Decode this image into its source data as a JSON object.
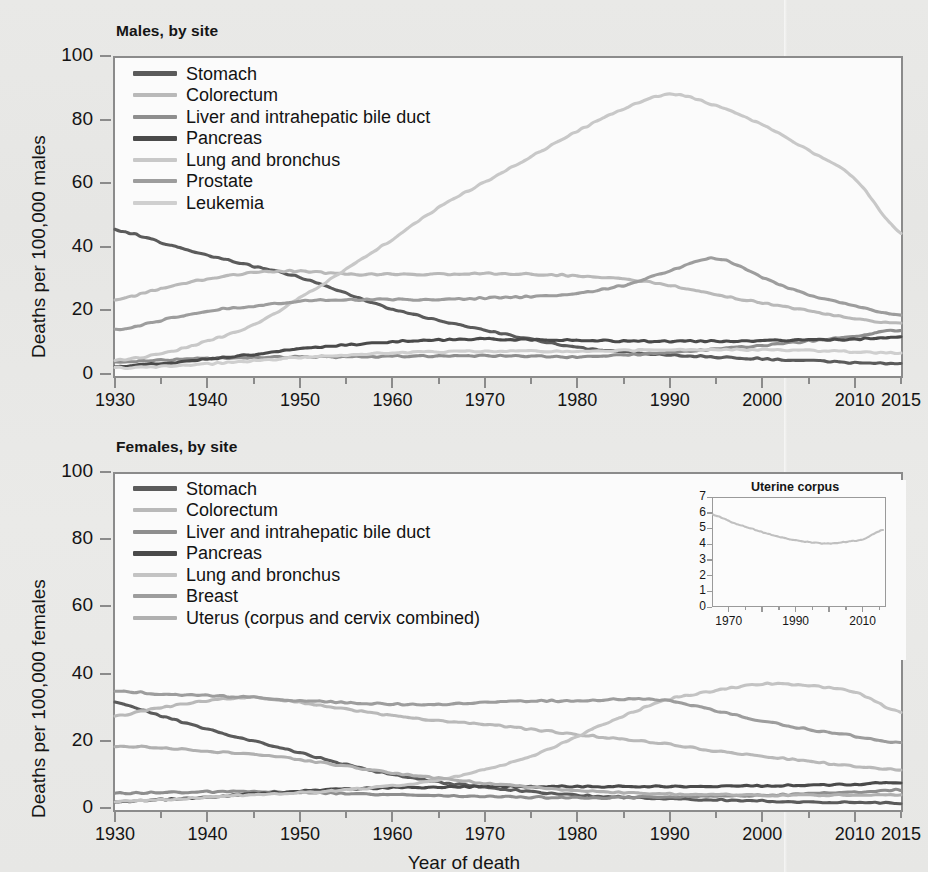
{
  "figure": {
    "xaxis_title": "Year of death",
    "background_hex": "#e8e8e6",
    "axis_hex": "#8b8b8b"
  },
  "panels": [
    {
      "id": "males",
      "title": "Males, by site",
      "ylabel": "Deaths per 100,000 males",
      "yticks": [
        "100",
        "80",
        "60",
        "40",
        "20",
        "0"
      ],
      "xticks": [
        "1930",
        "1940",
        "1950",
        "1960",
        "1970",
        "1980",
        "1990",
        "2000",
        "2010",
        "2015"
      ],
      "legend": [
        {
          "label": "Stomach",
          "color": "#5b5b5b"
        },
        {
          "label": "Colorectum",
          "color": "#b9b9b9"
        },
        {
          "label": "Liver and intrahepatic bile duct",
          "color": "#8e8e8e"
        },
        {
          "label": "Pancreas",
          "color": "#4a4a4a"
        },
        {
          "label": "Lung and bronchus",
          "color": "#c8c8c8"
        },
        {
          "label": "Prostate",
          "color": "#9d9d9d"
        },
        {
          "label": "Leukemia",
          "color": "#cfcfcf"
        }
      ]
    },
    {
      "id": "females",
      "title": "Females, by site",
      "ylabel": "Deaths per 100,000 females",
      "yticks": [
        "100",
        "80",
        "60",
        "40",
        "20",
        "0"
      ],
      "xticks": [
        "1930",
        "1940",
        "1950",
        "1960",
        "1970",
        "1980",
        "1990",
        "2000",
        "2010",
        "2015"
      ],
      "legend": [
        {
          "label": "Stomach",
          "color": "#5b5b5b"
        },
        {
          "label": "Colorectum",
          "color": "#b9b9b9"
        },
        {
          "label": "Liver and intrahepatic bile duct",
          "color": "#8e8e8e"
        },
        {
          "label": "Pancreas",
          "color": "#4a4a4a"
        },
        {
          "label": "Lung and bronchus",
          "color": "#c3c3c3"
        },
        {
          "label": "Breast",
          "color": "#9d9d9d"
        },
        {
          "label": "Uterus (corpus and cervix combined)",
          "color": "#b0b0b0"
        }
      ],
      "inset": {
        "title": "Uterine corpus",
        "yticks": [
          "7",
          "6",
          "5",
          "4",
          "3",
          "2",
          "1",
          "0"
        ],
        "xticks": [
          "1970",
          "1990",
          "2010"
        ]
      }
    }
  ],
  "chart_data": [
    {
      "type": "line",
      "id": "males-by-site",
      "title": "Males, by site",
      "xlabel": "Year of death",
      "ylabel": "Deaths per 100,000 males",
      "xlim": [
        1930,
        2015
      ],
      "ylim": [
        0,
        100
      ],
      "ytick_values": [
        0,
        20,
        40,
        60,
        80,
        100
      ],
      "xtick_values": [
        1930,
        1940,
        1950,
        1960,
        1970,
        1980,
        1990,
        2000,
        2010,
        2015
      ],
      "grid": false,
      "legend_position": "inside-top-left",
      "x": [
        1930,
        1935,
        1940,
        1945,
        1950,
        1955,
        1960,
        1965,
        1970,
        1975,
        1980,
        1985,
        1990,
        1995,
        2000,
        2005,
        2010,
        2015
      ],
      "series": [
        {
          "name": "Stomach",
          "color": "#5b5b5b",
          "values": [
            46.0,
            42.0,
            38.0,
            34.5,
            31.0,
            26.0,
            21.0,
            17.5,
            14.5,
            11.5,
            9.0,
            7.6,
            6.6,
            6.0,
            5.4,
            4.8,
            4.2,
            3.8
          ]
        },
        {
          "name": "Colorectum",
          "color": "#b9b9b9",
          "values": [
            24.0,
            27.5,
            30.5,
            32.5,
            33.0,
            32.0,
            32.0,
            32.0,
            32.2,
            32.0,
            31.5,
            30.5,
            28.5,
            25.5,
            23.0,
            20.5,
            18.0,
            16.5
          ]
        },
        {
          "name": "Liver and intrahepatic bile duct",
          "color": "#8e8e8e",
          "values": [
            4.5,
            5.0,
            5.5,
            5.8,
            6.0,
            6.0,
            6.2,
            6.3,
            6.4,
            6.2,
            6.0,
            6.6,
            7.4,
            8.4,
            9.6,
            11.0,
            12.6,
            14.5
          ]
        },
        {
          "name": "Pancreas",
          "color": "#4a4a4a",
          "values": [
            3.0,
            4.0,
            5.3,
            6.8,
            8.5,
            9.7,
            10.8,
            11.3,
            11.6,
            11.4,
            11.2,
            11.0,
            10.9,
            11.0,
            11.1,
            11.3,
            11.6,
            12.2
          ]
        },
        {
          "name": "Lung and bronchus",
          "color": "#c8c8c8",
          "values": [
            5.0,
            7.0,
            11.0,
            16.0,
            24.5,
            33.5,
            43.0,
            53.0,
            61.0,
            69.0,
            77.0,
            84.0,
            88.5,
            85.0,
            79.0,
            71.0,
            62.0,
            45.0
          ]
        },
        {
          "name": "Prostate",
          "color": "#9d9d9d",
          "values": [
            14.5,
            17.5,
            20.5,
            22.0,
            23.5,
            24.0,
            24.0,
            24.0,
            24.5,
            25.0,
            26.0,
            28.5,
            33.0,
            37.0,
            31.0,
            25.5,
            22.0,
            19.0
          ]
        },
        {
          "name": "Leukemia",
          "color": "#cfcfcf",
          "values": [
            2.5,
            3.0,
            3.8,
            4.8,
            5.8,
            6.6,
            7.3,
            7.6,
            7.8,
            7.8,
            7.8,
            8.0,
            8.2,
            8.3,
            8.2,
            8.0,
            7.6,
            7.2
          ]
        }
      ]
    },
    {
      "type": "line",
      "id": "females-by-site",
      "title": "Females, by site",
      "xlabel": "Year of death",
      "ylabel": "Deaths per 100,000 females",
      "xlim": [
        1930,
        2015
      ],
      "ylim": [
        0,
        100
      ],
      "ytick_values": [
        0,
        20,
        40,
        60,
        80,
        100
      ],
      "xtick_values": [
        1930,
        1940,
        1950,
        1960,
        1970,
        1980,
        1990,
        2000,
        2010,
        2015
      ],
      "grid": false,
      "legend_position": "inside-top-left",
      "x": [
        1930,
        1935,
        1940,
        1945,
        1950,
        1955,
        1960,
        1965,
        1970,
        1975,
        1980,
        1985,
        1990,
        1995,
        2000,
        2005,
        2010,
        2015
      ],
      "series": [
        {
          "name": "Stomach",
          "color": "#5b5b5b",
          "values": [
            32.0,
            28.0,
            24.0,
            20.5,
            17.0,
            13.5,
            10.5,
            8.3,
            6.8,
            5.5,
            4.4,
            3.8,
            3.3,
            3.0,
            2.7,
            2.4,
            2.2,
            2.0
          ]
        },
        {
          "name": "Colorectum",
          "color": "#b9b9b9",
          "values": [
            28.0,
            30.5,
            32.5,
            33.5,
            32.0,
            30.0,
            28.0,
            26.5,
            25.5,
            24.0,
            22.5,
            21.0,
            19.5,
            17.5,
            16.0,
            14.5,
            13.0,
            12.0
          ]
        },
        {
          "name": "Liver and intrahepatic bile duct",
          "color": "#8e8e8e",
          "values": [
            5.0,
            5.2,
            5.4,
            5.4,
            5.2,
            4.9,
            4.6,
            4.3,
            4.0,
            3.8,
            3.6,
            3.7,
            3.9,
            4.1,
            4.4,
            4.8,
            5.3,
            6.0
          ]
        },
        {
          "name": "Pancreas",
          "color": "#4a4a4a",
          "values": [
            2.5,
            3.1,
            3.9,
            4.8,
            5.6,
            6.2,
            6.6,
            6.8,
            7.0,
            7.0,
            7.0,
            7.0,
            7.0,
            7.1,
            7.2,
            7.4,
            7.7,
            8.2
          ]
        },
        {
          "name": "Lung and bronchus",
          "color": "#c3c3c3",
          "values": [
            2.5,
            3.0,
            3.8,
            4.5,
            5.2,
            6.0,
            7.2,
            9.0,
            12.0,
            16.0,
            22.0,
            28.0,
            33.0,
            35.5,
            37.5,
            37.0,
            35.0,
            29.0
          ]
        },
        {
          "name": "Breast",
          "color": "#9d9d9d",
          "values": [
            35.5,
            34.5,
            34.0,
            33.5,
            32.5,
            32.0,
            31.5,
            31.5,
            32.0,
            32.5,
            32.5,
            33.0,
            32.5,
            29.5,
            26.5,
            24.0,
            22.0,
            20.0
          ]
        },
        {
          "name": "Uterus (corpus and cervix combined)",
          "color": "#b0b0b0",
          "values": [
            19.0,
            18.5,
            17.5,
            16.5,
            15.0,
            13.0,
            11.0,
            9.5,
            8.0,
            6.8,
            5.8,
            5.2,
            4.8,
            4.6,
            4.4,
            4.4,
            4.4,
            4.4
          ]
        }
      ]
    },
    {
      "type": "line",
      "id": "uterine-corpus-inset",
      "title": "Uterine corpus",
      "xlabel": "",
      "ylabel": "",
      "xlim": [
        1970,
        2015
      ],
      "ylim": [
        0,
        7
      ],
      "ytick_values": [
        0,
        1,
        2,
        3,
        4,
        5,
        6,
        7
      ],
      "xtick_values": [
        1970,
        1990,
        2010
      ],
      "grid": false,
      "x": [
        1970,
        1975,
        1980,
        1985,
        1990,
        1995,
        2000,
        2005,
        2010,
        2015
      ],
      "series": [
        {
          "name": "Uterine corpus",
          "color": "#c0c0c0",
          "values": [
            5.9,
            5.4,
            5.0,
            4.6,
            4.3,
            4.1,
            4.0,
            4.1,
            4.3,
            4.9
          ]
        }
      ]
    }
  ]
}
